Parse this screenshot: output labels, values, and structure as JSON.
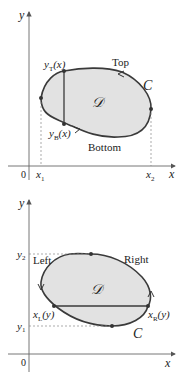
{
  "diagrams": [
    {
      "name": "vertical-slicing",
      "axes": {
        "x_label": "x",
        "y_label": "y",
        "origin_label": "0"
      },
      "region_label": "𝒟",
      "curve_label": "C",
      "tick_labels": {
        "x1": "x",
        "x1_sub": "1",
        "x2": "x",
        "x2_sub": "2"
      },
      "boundary_labels": {
        "top": "Top",
        "bottom": "Bottom",
        "y_top": "y",
        "y_top_sub": "T",
        "y_top_arg": "(x)",
        "y_bottom": "y",
        "y_bottom_sub": "B",
        "y_bottom_arg": "(x)"
      }
    },
    {
      "name": "horizontal-slicing",
      "axes": {
        "x_label": "x",
        "y_label": "y",
        "origin_label": "0"
      },
      "region_label": "𝒟",
      "curve_label": "C",
      "tick_labels": {
        "y1": "y",
        "y1_sub": "1",
        "y2": "y",
        "y2_sub": "2"
      },
      "boundary_labels": {
        "left": "Left",
        "right": "Right",
        "x_left": "x",
        "x_left_sub": "L",
        "x_left_arg": "(y)",
        "x_right": "x",
        "x_right_sub": "R",
        "x_right_arg": "(y)"
      }
    }
  ],
  "colors": {
    "region_fill": "#e2e2e2",
    "curve": "#3a3a3a",
    "axis": "#555555",
    "dashed": "#888888"
  }
}
